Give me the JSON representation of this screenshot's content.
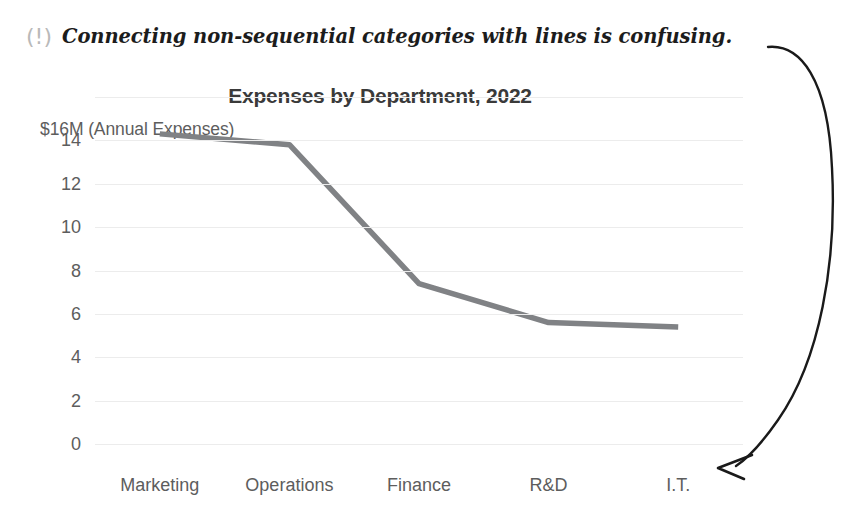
{
  "annotation": {
    "icon": "warning-exclamation-icon",
    "icon_glyph": "(!)",
    "text": "Connecting non-sequential categories with lines is confusing.",
    "arrow": "curved-arrow-pointing-to-x-axis",
    "text_color": "#1c1c1c",
    "icon_color": "#b9b9b9",
    "arrow_color": "#1a1a1a"
  },
  "chart_data": {
    "type": "line",
    "title": "Expenses by Department, 2022",
    "xlabel": "",
    "ylabel": "$16M (Annual Expenses)",
    "categories": [
      "Marketing",
      "Operations",
      "Finance",
      "R&D",
      "I.T."
    ],
    "values": [
      14.3,
      13.8,
      7.4,
      5.6,
      5.4
    ],
    "series": [
      {
        "name": "Annual Expenses",
        "values": [
          14.3,
          13.8,
          7.4,
          5.6,
          5.4
        ]
      }
    ],
    "ylim": [
      0,
      16
    ],
    "yticks": [
      0,
      2,
      4,
      6,
      8,
      10,
      12,
      14
    ],
    "ytick_labels": [
      "0",
      "2",
      "4",
      "6",
      "8",
      "10",
      "12",
      "14"
    ],
    "grid": true,
    "legend": false,
    "line_color": "#808285",
    "grid_color": "#ececec",
    "tick_color": "#5d5d5d",
    "title_color": "#3a3a3a",
    "units": "millions of dollars"
  }
}
